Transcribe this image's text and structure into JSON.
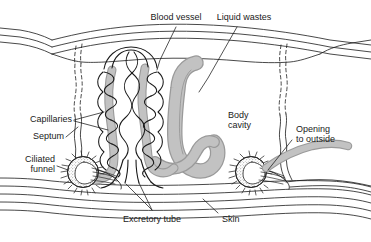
{
  "figure": {
    "type": "biological-diagram",
    "background_color": "#ffffff",
    "ink_color": "#1a1a1a",
    "tissue_gray": "#b5b5b5",
    "tissue_gray_dark": "#9a9a9a"
  },
  "labels": {
    "blood_vessel": "Blood vessel",
    "liquid_wastes": "Liquid wastes",
    "capillaries": "Capillaries",
    "septum": "Septum",
    "ciliated_funnel_line1": "Ciliated",
    "ciliated_funnel_line2": "funnel",
    "body_cavity_line1": "Body",
    "body_cavity_line2": "cavity",
    "opening_line1": "Opening",
    "opening_line2": "to outside",
    "excretory_tube": "Excretory tube",
    "skin": "Skin"
  },
  "structures": [
    {
      "name": "blood-vessel",
      "description": "black capillary coils wrapping excretory tubes"
    },
    {
      "name": "liquid-wastes",
      "description": "large gray looping bladder tube in body cavity"
    },
    {
      "name": "capillaries",
      "description": "coiled black vessels around the nephridium tubules"
    },
    {
      "name": "septum",
      "description": "wavy vertical partition lines separating body segments"
    },
    {
      "name": "ciliated-funnel",
      "description": "stippled circular funnel ringed with cilia"
    },
    {
      "name": "body-cavity",
      "description": "open interior space of the segment"
    },
    {
      "name": "opening-to-outside",
      "description": "gray duct exiting through the body wall"
    },
    {
      "name": "excretory-tube",
      "description": "paired tubules descending to the nephridiopore"
    },
    {
      "name": "skin",
      "description": "layered wavy body wall lines"
    }
  ]
}
